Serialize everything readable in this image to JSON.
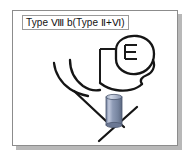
{
  "figure": {
    "label": "Type Ⅷ b(Type Ⅱ+Ⅵ)",
    "frame_border_color": "#8c8c8c",
    "shadow_color": "#b8b8b8",
    "background_color": "#ffffff",
    "ink_color": "#151515",
    "label_border_color": "#9a9a9a"
  },
  "diagram": {
    "title": "Type Ⅷ b(Type Ⅱ+Ⅵ)",
    "type": "line-drawing",
    "parts": [
      {
        "name": "head-outline",
        "shape": "oval",
        "color": "#151515"
      },
      {
        "name": "ear-marking",
        "shape": "e-glyph",
        "color": "#151515"
      },
      {
        "name": "jaw-curve",
        "shape": "curve",
        "color": "#151515"
      },
      {
        "name": "neck-left-line",
        "shape": "curve",
        "color": "#151515"
      },
      {
        "name": "shoulder-curve",
        "shape": "curve",
        "color": "#151515"
      },
      {
        "name": "bracket-line",
        "shape": "l-bracket",
        "color": "#1a1a1a"
      },
      {
        "name": "vessel-line",
        "shape": "diagonal",
        "color": "#151515"
      },
      {
        "name": "lower-y-branch",
        "shape": "y-fork",
        "color": "#151515"
      }
    ],
    "cylinder": {
      "name": "stent-cylinder",
      "fill_top": "#a8b4cc",
      "fill_mid": "#7e8ca8",
      "fill_light": "#c4ccdc",
      "fill_dark": "#5f6d8a",
      "outline": "#4d5870",
      "x": 93,
      "y": 84,
      "width": 16,
      "height": 30
    }
  }
}
